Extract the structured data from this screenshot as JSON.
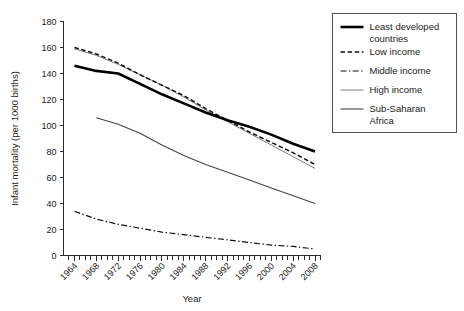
{
  "chart_data": {
    "type": "line",
    "title": "",
    "xlabel": "Year",
    "ylabel": "Infant mortality (per 1000 births)",
    "xlim": [
      1962,
      2009
    ],
    "ylim": [
      0,
      180
    ],
    "yticks": [
      0,
      20,
      40,
      60,
      80,
      100,
      120,
      140,
      160,
      180
    ],
    "xticks": [
      1964,
      1968,
      1972,
      1976,
      1980,
      1984,
      1988,
      1992,
      1996,
      2000,
      2004,
      2008
    ],
    "xtick_labels": [
      "1964",
      "1968",
      "1972",
      "1976",
      "1980",
      "1984",
      "1988",
      "1992",
      "1996",
      "2000",
      "2004",
      "2008"
    ],
    "ytick_labels": [
      "0",
      "20",
      "40",
      "60",
      "80",
      "100",
      "120",
      "140",
      "160",
      "180"
    ],
    "minor_xtick_step": 1,
    "grid": false,
    "legend_position": "right",
    "x": [
      1964,
      1968,
      1972,
      1976,
      1980,
      1984,
      1988,
      1992,
      1996,
      2000,
      2004,
      2008
    ],
    "series": [
      {
        "name": "Least developed countries",
        "style": "solid-thick",
        "color": "#000000",
        "width": 2.6,
        "values": [
          146,
          142,
          140,
          132,
          124,
          117,
          110,
          104,
          99,
          93,
          86,
          80
        ]
      },
      {
        "name": "Low income",
        "style": "dashed",
        "color": "#111111",
        "width": 1.5,
        "values": [
          160,
          155,
          148,
          139,
          131,
          123,
          113,
          104,
          95,
          87,
          79,
          70
        ]
      },
      {
        "name": "Middle income",
        "style": "dash-dot",
        "color": "#111111",
        "width": 1.2,
        "values": [
          34,
          28,
          24,
          21,
          18,
          16,
          14,
          12,
          10,
          8,
          7,
          5
        ]
      },
      {
        "name": "High income",
        "style": "solid-thin-light",
        "color": "#7a7a7a",
        "width": 1.0,
        "values": [
          null,
          null,
          null,
          null,
          null,
          null,
          null,
          null,
          null,
          null,
          null,
          null
        ]
      },
      {
        "name": "Sub-Saharan Africa",
        "style": "solid-thin",
        "color": "#444444",
        "width": 1.1,
        "values": [
          null,
          106,
          101,
          94,
          85,
          77,
          70,
          64,
          58,
          52,
          46,
          40
        ]
      }
    ],
    "series_detail": {
      "high_income_note": "thin light-grey line, overlapping Low income in upper region",
      "high_income_x": [
        1964,
        1968,
        1972,
        1976,
        1980,
        1984,
        1988,
        1992,
        1996,
        2000,
        2004,
        2008
      ],
      "high_income_values": [
        159,
        154,
        147,
        139,
        131,
        122,
        112,
        103,
        94,
        85,
        76,
        67
      ]
    }
  },
  "legend": {
    "entries": [
      {
        "label": "Least developed countries"
      },
      {
        "label": "Low income"
      },
      {
        "label": "Middle income"
      },
      {
        "label": "High income"
      },
      {
        "label": "Sub-Saharan Africa"
      }
    ]
  },
  "axes": {
    "x_title": "Year",
    "y_title": "Infant mortality (per 1000 births)"
  }
}
